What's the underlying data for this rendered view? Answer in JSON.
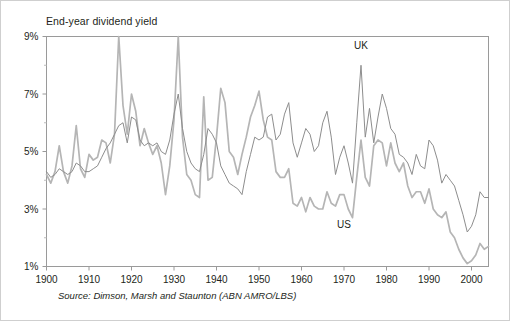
{
  "figure": {
    "title": "End-year dividend yield",
    "source_note": "Source: Dimson, Marsh and Staunton (ABN AMRO/LBS)",
    "background_color": "#ffffff",
    "frame_color": "#9a9a9a",
    "border_color": "#cfcfcf"
  },
  "chart_data": {
    "type": "line",
    "title": "End-year dividend yield",
    "subtitle": "",
    "xlabel": "",
    "ylabel": "",
    "xlim": [
      1900,
      2004
    ],
    "ylim": [
      1,
      9
    ],
    "ytick_labels": [
      "9%",
      "7%",
      "5%",
      "3%",
      "1%"
    ],
    "ytick_values": [
      9,
      7,
      5,
      3,
      1
    ],
    "yminor_values": [
      8,
      6,
      4,
      2
    ],
    "xtick_labels": [
      "1900",
      "1910",
      "1920",
      "1930",
      "1940",
      "1950",
      "1960",
      "1970",
      "1980",
      "1990",
      "2000"
    ],
    "xtick_values": [
      1900,
      1910,
      1920,
      1930,
      1940,
      1950,
      1960,
      1970,
      1980,
      1990,
      2000
    ],
    "grid": false,
    "legend_position": "inline-annotation",
    "annotations": [
      {
        "text": "UK",
        "x": 1974,
        "y": 8.55
      },
      {
        "text": "US",
        "x": 1970,
        "y": 2.35
      }
    ],
    "series": [
      {
        "name": "UK",
        "color": "#8d8d8d",
        "width": 1.0,
        "x": [
          1900,
          1901,
          1902,
          1903,
          1904,
          1905,
          1906,
          1907,
          1908,
          1909,
          1910,
          1911,
          1912,
          1913,
          1914,
          1915,
          1916,
          1917,
          1918,
          1919,
          1920,
          1921,
          1922,
          1923,
          1924,
          1925,
          1926,
          1927,
          1928,
          1929,
          1930,
          1931,
          1932,
          1933,
          1934,
          1935,
          1936,
          1937,
          1938,
          1939,
          1940,
          1941,
          1942,
          1943,
          1944,
          1945,
          1946,
          1947,
          1948,
          1949,
          1950,
          1951,
          1952,
          1953,
          1954,
          1955,
          1956,
          1957,
          1958,
          1959,
          1960,
          1961,
          1962,
          1963,
          1964,
          1965,
          1966,
          1967,
          1968,
          1969,
          1970,
          1971,
          1972,
          1973,
          1974,
          1975,
          1976,
          1977,
          1978,
          1979,
          1980,
          1981,
          1982,
          1983,
          1984,
          1985,
          1986,
          1987,
          1988,
          1989,
          1990,
          1991,
          1992,
          1993,
          1994,
          1995,
          1996,
          1997,
          1998,
          1999,
          2000,
          2001,
          2002,
          2003,
          2004
        ],
        "values": [
          4.3,
          4.1,
          4.2,
          4.4,
          4.3,
          4.2,
          4.3,
          4.6,
          4.5,
          4.3,
          4.3,
          4.4,
          4.5,
          4.8,
          5.1,
          5.3,
          5.6,
          5.9,
          6.0,
          5.3,
          6.2,
          6.1,
          5.4,
          5.2,
          5.3,
          5.2,
          5.3,
          5.0,
          4.9,
          5.4,
          6.3,
          7.0,
          5.8,
          5.0,
          4.6,
          4.4,
          4.3,
          4.9,
          5.8,
          5.6,
          5.3,
          4.5,
          4.2,
          3.9,
          3.8,
          3.7,
          3.5,
          4.3,
          4.9,
          5.5,
          5.4,
          5.5,
          6.2,
          6.3,
          5.4,
          5.6,
          6.3,
          6.7,
          5.3,
          4.8,
          5.3,
          5.8,
          5.6,
          5.0,
          5.2,
          6.0,
          6.4,
          5.5,
          4.2,
          4.8,
          5.2,
          4.6,
          3.9,
          6.0,
          8.0,
          5.5,
          6.5,
          5.3,
          6.2,
          7.0,
          6.5,
          5.8,
          5.6,
          4.9,
          4.8,
          4.6,
          4.2,
          4.9,
          4.5,
          4.4,
          5.4,
          5.2,
          4.7,
          3.9,
          4.2,
          4.0,
          3.8,
          3.3,
          2.8,
          2.2,
          2.4,
          2.8,
          3.6,
          3.4,
          3.4
        ]
      },
      {
        "name": "US",
        "color": "#b5b5b5",
        "width": 1.7,
        "x": [
          1900,
          1901,
          1902,
          1903,
          1904,
          1905,
          1906,
          1907,
          1908,
          1909,
          1910,
          1911,
          1912,
          1913,
          1914,
          1915,
          1916,
          1917,
          1918,
          1919,
          1920,
          1921,
          1922,
          1923,
          1924,
          1925,
          1926,
          1927,
          1928,
          1929,
          1930,
          1931,
          1932,
          1933,
          1934,
          1935,
          1936,
          1937,
          1938,
          1939,
          1940,
          1941,
          1942,
          1943,
          1944,
          1945,
          1946,
          1947,
          1948,
          1949,
          1950,
          1951,
          1952,
          1953,
          1954,
          1955,
          1956,
          1957,
          1958,
          1959,
          1960,
          1961,
          1962,
          1963,
          1964,
          1965,
          1966,
          1967,
          1968,
          1969,
          1970,
          1971,
          1972,
          1973,
          1974,
          1975,
          1976,
          1977,
          1978,
          1979,
          1980,
          1981,
          1982,
          1983,
          1984,
          1985,
          1986,
          1987,
          1988,
          1989,
          1990,
          1991,
          1992,
          1993,
          1994,
          1995,
          1996,
          1997,
          1998,
          1999,
          2000,
          2001,
          2002,
          2003,
          2004
        ],
        "values": [
          4.2,
          3.9,
          4.3,
          5.2,
          4.3,
          3.9,
          4.5,
          5.9,
          4.4,
          4.1,
          4.9,
          4.7,
          4.8,
          5.4,
          5.3,
          4.6,
          5.6,
          9.0,
          6.6,
          5.6,
          7.0,
          6.4,
          5.2,
          5.8,
          5.3,
          4.9,
          5.2,
          4.6,
          3.5,
          4.5,
          6.1,
          9.0,
          5.5,
          4.2,
          4.0,
          3.5,
          3.4,
          6.9,
          4.0,
          4.1,
          5.5,
          7.2,
          6.7,
          5.0,
          4.8,
          4.2,
          4.9,
          5.5,
          6.2,
          6.6,
          7.1,
          6.1,
          5.5,
          5.4,
          4.3,
          4.1,
          4.1,
          4.4,
          3.2,
          3.1,
          3.4,
          2.9,
          3.4,
          3.1,
          3.0,
          3.0,
          3.6,
          3.2,
          3.1,
          3.5,
          3.5,
          3.0,
          2.7,
          4.1,
          5.4,
          4.1,
          3.8,
          5.2,
          5.4,
          5.3,
          4.5,
          5.3,
          4.6,
          4.3,
          4.6,
          3.8,
          3.4,
          3.6,
          3.6,
          3.2,
          3.7,
          3.0,
          2.8,
          2.7,
          2.9,
          2.2,
          2.0,
          1.6,
          1.3,
          1.1,
          1.2,
          1.4,
          1.8,
          1.6,
          1.7
        ]
      }
    ]
  },
  "axis": {
    "y_labels": [
      "9%",
      "7%",
      "5%",
      "3%",
      "1%"
    ],
    "x_labels": [
      "1900",
      "1910",
      "1920",
      "1930",
      "1940",
      "1950",
      "1960",
      "1970",
      "1980",
      "1990",
      "2000"
    ]
  },
  "labels": {
    "uk": "UK",
    "us": "US"
  }
}
